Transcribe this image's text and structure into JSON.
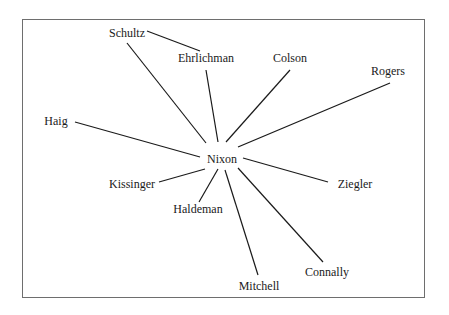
{
  "diagram": {
    "type": "network",
    "center": "Nixon",
    "nodes": [
      {
        "id": "nixon",
        "label": "Nixon",
        "x": 222,
        "y": 159
      },
      {
        "id": "schultz",
        "label": "Schultz",
        "x": 127,
        "y": 33
      },
      {
        "id": "ehrlichman",
        "label": "Ehrlichman",
        "x": 206,
        "y": 58
      },
      {
        "id": "colson",
        "label": "Colson",
        "x": 290,
        "y": 58
      },
      {
        "id": "rogers",
        "label": "Rogers",
        "x": 388,
        "y": 71
      },
      {
        "id": "haig",
        "label": "Haig",
        "x": 56,
        "y": 121
      },
      {
        "id": "kissinger",
        "label": "Kissinger",
        "x": 132,
        "y": 184
      },
      {
        "id": "haldeman",
        "label": "Haldeman",
        "x": 198,
        "y": 209
      },
      {
        "id": "ziegler",
        "label": "Ziegler",
        "x": 355,
        "y": 184
      },
      {
        "id": "mitchell",
        "label": "Mitchell",
        "x": 259,
        "y": 286
      },
      {
        "id": "connally",
        "label": "Connally",
        "x": 327,
        "y": 272
      }
    ],
    "edges": [
      {
        "from": "schultz",
        "to": "ehrlichman",
        "x1": 147,
        "y1": 31,
        "x2": 200,
        "y2": 51
      },
      {
        "from": "schultz",
        "to": "nixon",
        "x1": 127,
        "y1": 43,
        "x2": 206,
        "y2": 143
      },
      {
        "from": "ehrlichman",
        "to": "nixon",
        "x1": 206,
        "y1": 70,
        "x2": 218,
        "y2": 142
      },
      {
        "from": "colson",
        "to": "nixon",
        "x1": 290,
        "y1": 70,
        "x2": 226,
        "y2": 142
      },
      {
        "from": "rogers",
        "to": "nixon",
        "x1": 390,
        "y1": 83,
        "x2": 238,
        "y2": 147
      },
      {
        "from": "haig",
        "to": "nixon",
        "x1": 75,
        "y1": 122,
        "x2": 200,
        "y2": 157
      },
      {
        "from": "kissinger",
        "to": "nixon",
        "x1": 159,
        "y1": 182,
        "x2": 205,
        "y2": 169
      },
      {
        "from": "haldeman",
        "to": "nixon",
        "x1": 199,
        "y1": 202,
        "x2": 218,
        "y2": 169
      },
      {
        "from": "ziegler",
        "to": "nixon",
        "x1": 243,
        "y1": 158,
        "x2": 328,
        "y2": 182
      },
      {
        "from": "mitchell",
        "to": "nixon",
        "x1": 225,
        "y1": 170,
        "x2": 258,
        "y2": 275
      },
      {
        "from": "connally",
        "to": "nixon",
        "x1": 238,
        "y1": 168,
        "x2": 323,
        "y2": 262
      }
    ]
  }
}
